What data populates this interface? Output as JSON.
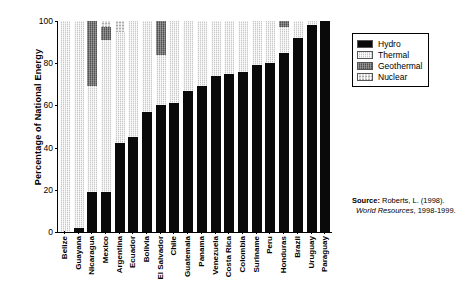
{
  "chart_data": {
    "type": "bar",
    "stacked": true,
    "title": "",
    "xlabel": "",
    "ylabel": "Percentage of National Energy",
    "ylim": [
      0,
      100
    ],
    "yticks": [
      0,
      20,
      40,
      60,
      80,
      100
    ],
    "grid": false,
    "legend_position": "upper right outside",
    "categories": [
      "Belize",
      "Guayana",
      "Nicaragua",
      "Mexico",
      "Argentina",
      "Ecuador",
      "Bolivia",
      "El Salvador",
      "Chile",
      "Guatemala",
      "Panama",
      "Venezuela",
      "Costa Rica",
      "Colombia",
      "Suriname",
      "Peru",
      "Honduras",
      "Brazil",
      "Uruguay",
      "Paraguay"
    ],
    "series": [
      {
        "name": "Hydro",
        "color": "#0a0a0a",
        "values": [
          0,
          2,
          19,
          19,
          42,
          45,
          57,
          60,
          61,
          67,
          69,
          74,
          75,
          76,
          79,
          80,
          85,
          92,
          98,
          100
        ]
      },
      {
        "name": "Thermal",
        "color": "#c8c8c8",
        "values": [
          100,
          98,
          50,
          72,
          53,
          55,
          43,
          24,
          39,
          33,
          31,
          26,
          25,
          24,
          21,
          20,
          12,
          8,
          2,
          0
        ]
      },
      {
        "name": "Geothermal",
        "color": "#6b6b6b",
        "values": [
          0,
          0,
          31,
          6,
          0,
          0,
          0,
          16,
          0,
          0,
          0,
          0,
          0,
          0,
          0,
          0,
          3,
          0,
          0,
          0
        ]
      },
      {
        "name": "Nuclear",
        "color": "#d9d9d9",
        "values": [
          0,
          0,
          0,
          3,
          5,
          0,
          0,
          0,
          0,
          0,
          0,
          0,
          0,
          0,
          0,
          0,
          0,
          0,
          0,
          0
        ]
      }
    ]
  },
  "legend": {
    "items": [
      {
        "label": "Hydro",
        "pattern": "solid-black"
      },
      {
        "label": "Thermal",
        "pattern": "light-hatch"
      },
      {
        "label": "Geothermal",
        "pattern": "dark-hatch"
      },
      {
        "label": "Nuclear",
        "pattern": "light-dot"
      }
    ]
  },
  "source": {
    "label": "Source:",
    "citation": "Roberts, L. (1998).",
    "publication": "World Resources",
    "years": ", 1998-1999."
  }
}
